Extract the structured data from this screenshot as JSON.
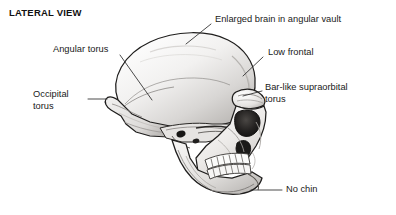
{
  "figure": {
    "title": "LATERAL VIEW",
    "background_color": "#ffffff",
    "ink_color": "#1a1a1a",
    "leader_color": "#2b2b2b"
  },
  "labels": {
    "enlarged_brain": "Enlarged brain in angular vault",
    "angular_torus": "Angular torus",
    "low_frontal": "Low frontal",
    "occipital_torus": "Occipital\ntorus",
    "supraorbital_torus": "Bar-like supraorbital\ntorus",
    "no_chin": "No chin"
  },
  "diagram_data": {
    "type": "annotated-illustration",
    "view": "lateral",
    "specimen": "skull",
    "annotation_count": 6,
    "annotations": [
      {
        "id": "enlarged-brain",
        "text": "Enlarged brain in angular vault",
        "text_anchor": [
          215,
          14
        ],
        "leader_from": [
          211,
          24
        ],
        "leader_to": [
          186,
          44
        ],
        "target_feature": "cranial-vault-superior"
      },
      {
        "id": "angular-torus",
        "text": "Angular torus",
        "text_anchor": [
          53,
          44
        ],
        "leader_from": [
          120,
          55
        ],
        "leader_to": [
          152,
          100
        ],
        "target_feature": "parietal-angular-torus"
      },
      {
        "id": "low-frontal",
        "text": "Low frontal",
        "text_anchor": [
          268,
          47
        ],
        "leader_from": [
          263,
          57
        ],
        "leader_to": [
          243,
          76
        ],
        "target_feature": "frontal-squama"
      },
      {
        "id": "occipital-torus",
        "text": "Occipital torus",
        "text_anchor": [
          33,
          89
        ],
        "leader_from": [
          88,
          99
        ],
        "leader_to": [
          107,
          99
        ],
        "target_feature": "occipital-torus"
      },
      {
        "id": "bar-like-supraorbital-torus",
        "text": "Bar-like supraorbital torus",
        "text_anchor": [
          265,
          82
        ],
        "leader_from": [
          262,
          91
        ],
        "leader_to": [
          243,
          96
        ],
        "target_feature": "supraorbital-browridge"
      },
      {
        "id": "no-chin",
        "text": "No chin",
        "text_anchor": [
          286,
          184
        ],
        "leader_from": [
          282,
          190
        ],
        "leader_to": [
          251,
          190
        ],
        "target_feature": "mandibular-symphysis"
      }
    ]
  }
}
